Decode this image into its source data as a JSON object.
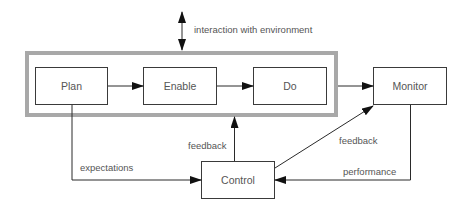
{
  "diagram": {
    "type": "process-flow",
    "group": {
      "label": "",
      "members": [
        "plan",
        "enable",
        "do"
      ],
      "style": "thick-gray-double-border"
    },
    "nodes": [
      {
        "id": "plan",
        "label": "Plan"
      },
      {
        "id": "enable",
        "label": "Enable"
      },
      {
        "id": "do",
        "label": "Do"
      },
      {
        "id": "monitor",
        "label": "Monitor"
      },
      {
        "id": "control",
        "label": "Control"
      }
    ],
    "edges": [
      {
        "from": "plan",
        "to": "enable",
        "label": ""
      },
      {
        "from": "enable",
        "to": "do",
        "label": ""
      },
      {
        "from": "group",
        "to": "monitor",
        "label": ""
      },
      {
        "from": "plan",
        "to": "control",
        "label": "expectations"
      },
      {
        "from": "monitor",
        "to": "control",
        "label": "performance"
      },
      {
        "from": "control",
        "to": "monitor",
        "label": "feedback"
      },
      {
        "from": "control",
        "to": "group",
        "label": "feedback"
      },
      {
        "from": "environment",
        "to": "group",
        "label": "interaction with environment",
        "bidirectional": true
      }
    ],
    "labels": {
      "interaction": "interaction with environment",
      "expectations": "expectations",
      "performance": "performance",
      "feedback_monitor": "feedback",
      "feedback_group": "feedback"
    },
    "colors": {
      "group_border": "#a8a8a8",
      "box_border": "#3a3a3a",
      "line": "#2a2a2a",
      "text": "#555555"
    }
  }
}
